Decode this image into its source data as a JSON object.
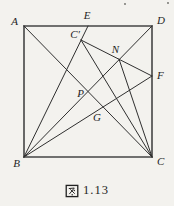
{
  "figure": {
    "colors": {
      "line": "#2f2f2f",
      "edge": "#454545",
      "text": "#1f1f1f",
      "background": "#f3f2ee"
    },
    "points": {
      "A": [
        24,
        26
      ],
      "B": [
        24,
        157
      ],
      "C": [
        152,
        157
      ],
      "D": [
        152,
        26
      ],
      "E": [
        88,
        26
      ],
      "C_prime": [
        81,
        40
      ],
      "F": [
        152,
        76
      ],
      "N": [
        119,
        59
      ],
      "P": [
        88,
        92
      ],
      "G": [
        103,
        107
      ]
    },
    "segments": [
      {
        "from": "A",
        "to": "D",
        "edge": true
      },
      {
        "from": "A",
        "to": "B",
        "edge": true
      },
      {
        "from": "B",
        "to": "C",
        "edge": true
      },
      {
        "from": "D",
        "to": "C",
        "edge": true
      },
      {
        "from": "A",
        "to": "C",
        "edge": false
      },
      {
        "from": "B",
        "to": "D",
        "edge": false
      },
      {
        "from": "B",
        "to": "E",
        "edge": false
      },
      {
        "from": "B",
        "to": "F",
        "edge": false
      },
      {
        "from": "C_prime",
        "to": "F",
        "edge": false
      },
      {
        "from": "C_prime",
        "to": "C",
        "edge": false
      },
      {
        "from": "N",
        "to": "C",
        "edge": false
      }
    ],
    "labels": [
      {
        "id": "A",
        "text": "A",
        "x": 18,
        "y": 25,
        "anchor": "end"
      },
      {
        "id": "D",
        "text": "D",
        "x": 157,
        "y": 24,
        "anchor": "start"
      },
      {
        "id": "B",
        "text": "B",
        "x": 20,
        "y": 167,
        "anchor": "end"
      },
      {
        "id": "C",
        "text": "C",
        "x": 157,
        "y": 165,
        "anchor": "start"
      },
      {
        "id": "E",
        "text": "E",
        "x": 87,
        "y": 19,
        "anchor": "middle"
      },
      {
        "id": "C-prime",
        "text": "C′",
        "x": 80,
        "y": 38,
        "anchor": "end"
      },
      {
        "id": "N",
        "text": "N",
        "x": 119,
        "y": 53,
        "anchor": "end"
      },
      {
        "id": "F",
        "text": "F",
        "x": 157,
        "y": 79,
        "anchor": "start"
      },
      {
        "id": "P",
        "text": "P",
        "x": 84,
        "y": 97,
        "anchor": "end"
      },
      {
        "id": "G",
        "text": "G",
        "x": 97,
        "y": 121,
        "anchor": "middle"
      }
    ],
    "specks": [
      [
        125,
        4
      ],
      [
        168,
        3
      ],
      [
        4,
        187
      ]
    ]
  },
  "caption": {
    "cjk": "图",
    "number": "1.13",
    "full": "图 1.13"
  }
}
